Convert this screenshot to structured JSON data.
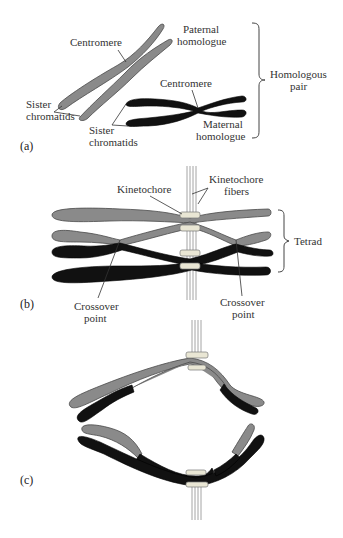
{
  "figure": {
    "colors": {
      "paternal": "#8a8a8a",
      "maternal": "#111111",
      "kinetochore": "#e9e6d4",
      "fiber": "#9a9a9a"
    },
    "panel_a": {
      "label": "(a)",
      "paternal": {
        "centromere": "Centromere",
        "homologue_line1": "Paternal",
        "homologue_line2": "homologue",
        "sister_line1": "Sister",
        "sister_line2": "chromatids"
      },
      "maternal": {
        "centromere": "Centromere",
        "homologue_line1": "Maternal",
        "homologue_line2": "homologue",
        "sister_line1": "Sister",
        "sister_line2": "chromatids"
      },
      "brace_line1": "Homologous",
      "brace_line2": "pair"
    },
    "panel_b": {
      "label": "(b)",
      "kinetochore": "Kinetochore",
      "fibers_line1": "Kinetochore",
      "fibers_line2": "fibers",
      "tetrad": "Tetrad",
      "crossover_left_line1": "Crossover",
      "crossover_left_line2": "point",
      "crossover_right_line1": "Crossover",
      "crossover_right_line2": "point"
    },
    "panel_c": {
      "label": "(c)"
    }
  }
}
